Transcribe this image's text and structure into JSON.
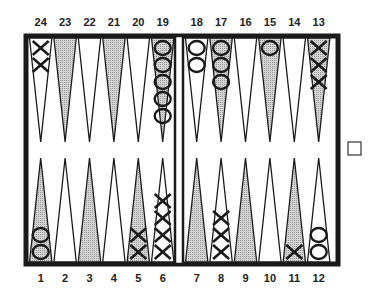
{
  "colors": {
    "frame": "#1a1a1a",
    "board_bg": "#ffffff",
    "shaded_point": "#b8b8b8",
    "plain_point": "#ffffff",
    "checker_stroke": "#1a1a1a",
    "label": "#222222"
  },
  "top_labels": [
    "24",
    "23",
    "22",
    "21",
    "20",
    "19",
    "18",
    "17",
    "16",
    "15",
    "14",
    "13"
  ],
  "bottom_labels": [
    "1",
    "2",
    "3",
    "4",
    "5",
    "6",
    "7",
    "8",
    "9",
    "10",
    "11",
    "12"
  ],
  "points": [
    {
      "point": 1,
      "shaded": true,
      "checker": "O",
      "count": 2
    },
    {
      "point": 2,
      "shaded": false,
      "checker": null,
      "count": 0
    },
    {
      "point": 3,
      "shaded": true,
      "checker": null,
      "count": 0
    },
    {
      "point": 4,
      "shaded": false,
      "checker": null,
      "count": 0
    },
    {
      "point": 5,
      "shaded": true,
      "checker": "X",
      "count": 2
    },
    {
      "point": 6,
      "shaded": false,
      "checker": "X",
      "count": 4
    },
    {
      "point": 7,
      "shaded": true,
      "checker": null,
      "count": 0
    },
    {
      "point": 8,
      "shaded": false,
      "checker": "X",
      "count": 3
    },
    {
      "point": 9,
      "shaded": true,
      "checker": null,
      "count": 0
    },
    {
      "point": 10,
      "shaded": false,
      "checker": null,
      "count": 0
    },
    {
      "point": 11,
      "shaded": true,
      "checker": "X",
      "count": 1
    },
    {
      "point": 12,
      "shaded": false,
      "checker": "O",
      "count": 2
    },
    {
      "point": 13,
      "shaded": true,
      "checker": "X",
      "count": 3
    },
    {
      "point": 14,
      "shaded": false,
      "checker": null,
      "count": 0
    },
    {
      "point": 15,
      "shaded": true,
      "checker": "O",
      "count": 1
    },
    {
      "point": 16,
      "shaded": false,
      "checker": null,
      "count": 0
    },
    {
      "point": 17,
      "shaded": true,
      "checker": "O",
      "count": 3
    },
    {
      "point": 18,
      "shaded": false,
      "checker": "O",
      "count": 2
    },
    {
      "point": 19,
      "shaded": true,
      "checker": "O",
      "count": 5
    },
    {
      "point": 20,
      "shaded": false,
      "checker": null,
      "count": 0
    },
    {
      "point": 21,
      "shaded": true,
      "checker": null,
      "count": 0
    },
    {
      "point": 22,
      "shaded": false,
      "checker": null,
      "count": 0
    },
    {
      "point": 23,
      "shaded": true,
      "checker": null,
      "count": 0
    },
    {
      "point": 24,
      "shaded": false,
      "checker": "X",
      "count": 2
    }
  ],
  "doubling_cube": {
    "value": "",
    "position": "right-center"
  }
}
